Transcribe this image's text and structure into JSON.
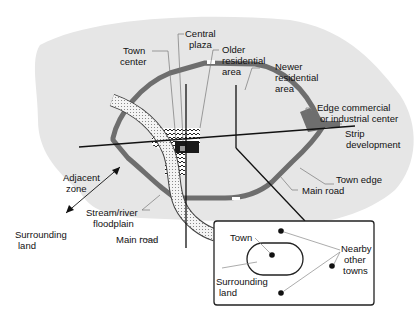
{
  "diagram": {
    "colors": {
      "surrounding_land": "#e6e6e6",
      "town_fill": "#ffffff",
      "town_edge": "#6e6e6e",
      "road": "#111111",
      "leader": "#777777",
      "center": "#1a1a1a",
      "plaza": "#9a9a9a"
    },
    "labels": {
      "town_center": [
        "Town",
        "center"
      ],
      "central_plaza": [
        "Central",
        "plaza"
      ],
      "older_residential": [
        "Older",
        "residential",
        "area"
      ],
      "newer_residential": [
        "Newer",
        "residential",
        "area"
      ],
      "edge_commercial": [
        "Edge commercial",
        "or industrial center"
      ],
      "strip_development": [
        "Strip",
        "development"
      ],
      "town_edge": "Town edge",
      "main_road_right": "Main road",
      "adjacent_zone": [
        "Adjacent",
        "zone"
      ],
      "stream_floodplain": [
        "Stream/river",
        "floodplain"
      ],
      "main_road_bottom": "Main road",
      "surrounding_land": [
        "Surrounding",
        "land"
      ]
    },
    "inset": {
      "town": "Town",
      "surrounding_land": [
        "Surrounding",
        "land"
      ],
      "nearby_towns": [
        "Nearby",
        "other",
        "towns"
      ]
    }
  }
}
